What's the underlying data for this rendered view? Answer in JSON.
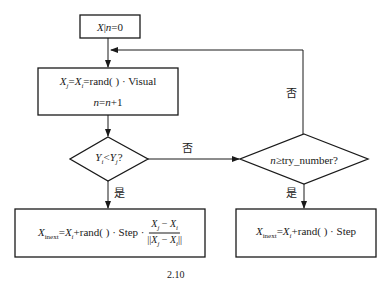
{
  "nodes": {
    "init": {
      "text": "X|n=0"
    },
    "visual": {
      "line1": "Xj=Xi=rand( ) · Visual",
      "line2": "n=n+1"
    },
    "cond1": {
      "text": "Yi<Yj?"
    },
    "cond2": {
      "text": "n≥try_number?"
    },
    "step_towards": {
      "lhs": "Xinext",
      "mid": "=Xi+rand( ) · Step ·",
      "num": "Xj − Xi",
      "den": "||Xj − Xi||"
    },
    "random_step": {
      "text": "Xinext=Xi+rand( ) · Step"
    }
  },
  "edge_labels": {
    "cond1_no": "否",
    "cond1_yes": "是",
    "cond2_no": "否",
    "cond2_yes": "是"
  },
  "caption": "2.10",
  "colors": {
    "line": "#1a1a1a",
    "background": "#ffffff"
  }
}
